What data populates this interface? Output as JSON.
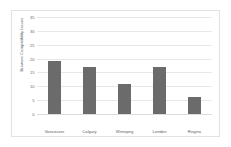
{
  "chart_data": {
    "type": "bar",
    "title": "",
    "subtitle": "",
    "xlabel": "",
    "ylabel": "Browser Compatibility Issues",
    "categories": [
      "Vancouver",
      "Calgary",
      "Winnipeg",
      "London",
      "Regina"
    ],
    "values": [
      19,
      17,
      11,
      17,
      6
    ],
    "series": [
      {
        "name": "Browser Compatibility Issues",
        "values": [
          19,
          17,
          11,
          17,
          6
        ]
      }
    ],
    "ylim": [
      0,
      35
    ],
    "ytick_labels": [
      "0",
      "5",
      "10",
      "15",
      "20",
      "25",
      "30",
      "35"
    ],
    "ytick_values": [
      0,
      5,
      10,
      15,
      20,
      25,
      30,
      35
    ],
    "grid": true,
    "grid_axis": "y",
    "legend": false,
    "legend_position": "none",
    "bar_color": "#6b6b6b",
    "plot_background": "#ffffff",
    "gridline_color": "#e8e8e8",
    "border_color": "#e2e2e2",
    "tick_label_color": "#6b6b6d",
    "axis_title_color": "#59595b"
  }
}
